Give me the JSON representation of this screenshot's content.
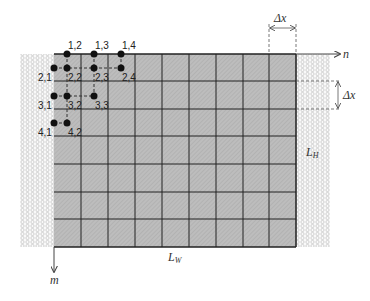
{
  "diagram": {
    "type": "finite-difference grid",
    "grid": {
      "columns": 9,
      "rows": 7
    },
    "axes": {
      "horizontal": "n",
      "vertical": "m"
    },
    "dimensions": {
      "width_label": "L",
      "width_sub": "W",
      "height_label": "L",
      "height_sub": "H",
      "step_top": "Δx",
      "step_right": "Δx"
    },
    "nodes": [
      {
        "id": "1,2",
        "label": "1,2"
      },
      {
        "id": "1,3",
        "label": "1,3"
      },
      {
        "id": "1,4",
        "label": "1,4"
      },
      {
        "id": "2,1",
        "label": "2,1"
      },
      {
        "id": "2,2",
        "label": "2,2"
      },
      {
        "id": "2,3",
        "label": "2,3"
      },
      {
        "id": "2,4",
        "label": "2,4"
      },
      {
        "id": "3,1",
        "label": "3,1"
      },
      {
        "id": "3,2",
        "label": "3,2"
      },
      {
        "id": "3,3",
        "label": "3,3"
      },
      {
        "id": "4,1",
        "label": "4,1"
      },
      {
        "id": "4,2",
        "label": "4,2"
      }
    ],
    "colors": {
      "grid_fill": "#b8b8b8",
      "grid_line": "#222222",
      "insulation": "#d8d8d8",
      "node": "#111111"
    }
  }
}
